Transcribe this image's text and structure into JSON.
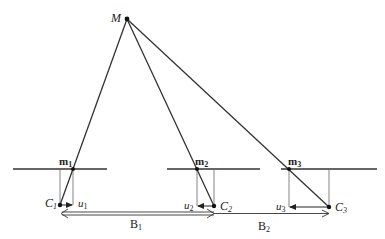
{
  "diagram": {
    "type": "multi-view projection geometry",
    "point": {
      "label": "M",
      "x": 127,
      "y": 19
    },
    "image_planes": [
      {
        "id": 1,
        "x1": 13,
        "x2": 107,
        "y": 169
      },
      {
        "id": 2,
        "x1": 167,
        "x2": 260,
        "y": 169
      },
      {
        "id": 3,
        "x1": 281,
        "x2": 377,
        "y": 169
      }
    ],
    "projections": [
      {
        "label": "m",
        "sub": "1",
        "x": 73,
        "y": 169
      },
      {
        "label": "m",
        "sub": "2",
        "x": 197,
        "y": 169
      },
      {
        "label": "m",
        "sub": "3",
        "x": 289,
        "y": 169
      }
    ],
    "cameras": [
      {
        "label": "C",
        "sub": "1",
        "x": 60,
        "y": 205
      },
      {
        "label": "C",
        "sub": "2",
        "x": 214,
        "y": 206
      },
      {
        "label": "C",
        "sub": "3",
        "x": 329,
        "y": 207
      }
    ],
    "offsets": [
      {
        "label": "u",
        "sub": "1"
      },
      {
        "label": "u",
        "sub": "2"
      },
      {
        "label": "u",
        "sub": "3"
      }
    ],
    "baselines": [
      {
        "label": "B",
        "sub": "1"
      },
      {
        "label": "B",
        "sub": "2"
      }
    ]
  },
  "labels": {
    "M": "M",
    "m1": "m",
    "m1_sub": "1",
    "m2": "m",
    "m2_sub": "2",
    "m3": "m",
    "m3_sub": "3",
    "C1": "C",
    "C1_sub": "1",
    "C2": "C",
    "C2_sub": "2",
    "C3": "C",
    "C3_sub": "3",
    "u1": "u",
    "u1_sub": "1",
    "u2": "u",
    "u2_sub": "2",
    "u3": "u",
    "u3_sub": "3",
    "B1": "B",
    "B1_sub": "1",
    "B2": "B",
    "B2_sub": "2"
  },
  "colors": {
    "line": "#333333",
    "thin": "#555555",
    "text": "#222222"
  }
}
